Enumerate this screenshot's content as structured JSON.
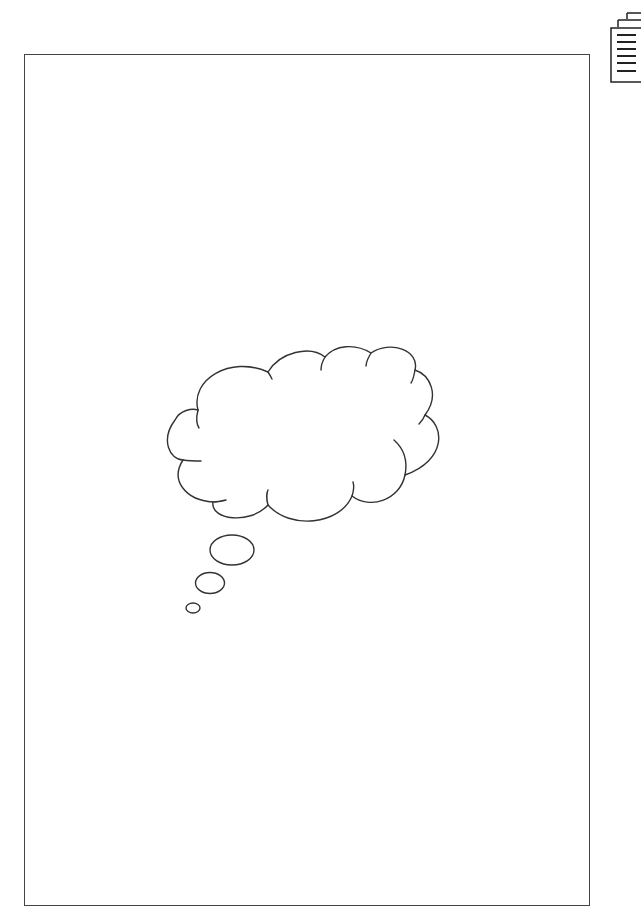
{
  "canvas": {
    "width": 641,
    "height": 921,
    "background": "#ffffff"
  },
  "page": {
    "border_color": "#444444"
  },
  "toolbar": {
    "icon": "document-pages-icon"
  },
  "illustration": {
    "type": "thought-bubble",
    "stroke_color": "#333333",
    "bubble_count": 3
  }
}
